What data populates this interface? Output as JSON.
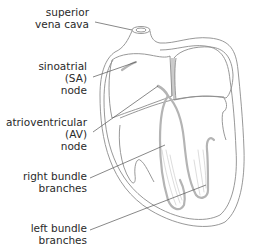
{
  "diagram": {
    "colors": {
      "outline": "#8c8c8c",
      "conduction": "#b4b4b4",
      "text": "#2a2a2a",
      "leader": "#555555"
    },
    "labels": [
      {
        "id": "superior-vena-cava",
        "lines": [
          "superior",
          "vena cava"
        ]
      },
      {
        "id": "sinoatrial-node",
        "lines": [
          "sinoatrial",
          "(SA)",
          "node"
        ]
      },
      {
        "id": "atrioventricular-node",
        "lines": [
          "atrioventricular",
          "(AV)",
          "node"
        ]
      },
      {
        "id": "right-bundle-branches",
        "lines": [
          "right bundle",
          "branches"
        ]
      },
      {
        "id": "left-bundle-branches",
        "lines": [
          "left bundle",
          "branches"
        ]
      }
    ]
  }
}
